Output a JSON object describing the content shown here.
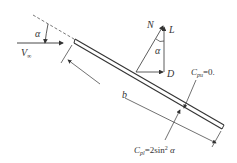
{
  "diagram": {
    "labels": {
      "alpha_top": "α",
      "freestream": "V",
      "freestream_sub": "∞",
      "normal": "N",
      "lift": "L",
      "drag": "D",
      "alpha_force": "α",
      "chord": "b",
      "upper_cp": "C",
      "upper_cp_sub": "pu",
      "upper_cp_val": "=0.",
      "lower_cp": "C",
      "lower_cp_sub": "pl",
      "lower_cp_val": "=2sin",
      "lower_cp_exp": "2",
      "lower_cp_tail": " α"
    },
    "colors": {
      "stroke": "#333333",
      "background": "#ffffff"
    }
  }
}
